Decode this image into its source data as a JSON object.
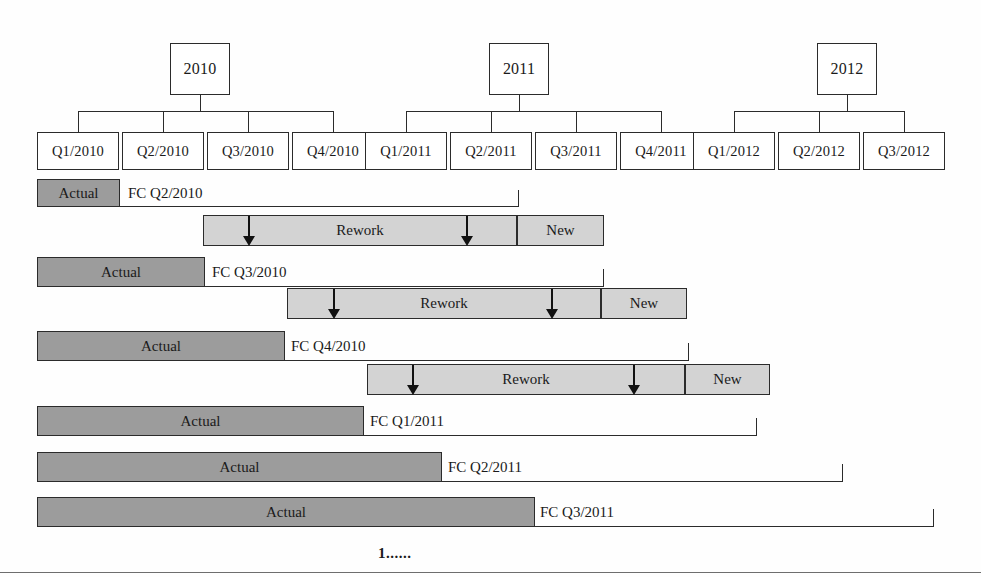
{
  "figure": {
    "footnote": "1......",
    "colors": {
      "actual_fill": "#9c9c9c",
      "forecast_fill": "#d3d3d3",
      "outline": "#2b2b2b",
      "background": "#ffffff"
    }
  },
  "timeline": {
    "years": [
      {
        "label": "2010",
        "x": 170,
        "width": 60,
        "quarters": 4
      },
      {
        "label": "2011",
        "x": 489,
        "width": 60,
        "quarters": 4
      },
      {
        "label": "2012",
        "x": 817,
        "width": 60,
        "quarters": 3
      }
    ],
    "quarters": [
      {
        "label": "Q1/2010",
        "x": 37,
        "width": 82
      },
      {
        "label": "Q2/2010",
        "x": 122,
        "width": 82
      },
      {
        "label": "Q3/2010",
        "x": 207,
        "width": 82
      },
      {
        "label": "Q4/2010",
        "x": 292,
        "width": 82
      },
      {
        "label": "Q1/2011",
        "x": 365,
        "width": 82
      },
      {
        "label": "Q2/2011",
        "x": 450,
        "width": 82
      },
      {
        "label": "Q3/2011",
        "x": 535,
        "width": 82
      },
      {
        "label": "Q4/2011",
        "x": 620,
        "width": 82
      },
      {
        "label": "Q1/2012",
        "x": 693,
        "width": 82
      },
      {
        "label": "Q2/2012",
        "x": 778,
        "width": 82
      },
      {
        "label": "Q3/2012",
        "x": 863,
        "width": 82
      }
    ]
  },
  "rows": [
    {
      "actual_label": "Actual",
      "actual_x": 37,
      "actual_width": 83,
      "fc_label": "FC Q2/2010",
      "fc_label_x": 128,
      "horizon_end": 518,
      "rework_label": "Rework",
      "rework_x": 203,
      "rework_width": 314,
      "new_label": "New",
      "new_x": 517,
      "new_width": 87,
      "arrows": [
        248,
        466
      ]
    },
    {
      "actual_label": "Actual",
      "actual_x": 37,
      "actual_width": 168,
      "fc_label": "FC Q3/2010",
      "fc_label_x": 212,
      "horizon_end": 603,
      "rework_label": "Rework",
      "rework_x": 287,
      "rework_width": 314,
      "new_label": "New",
      "new_x": 601,
      "new_width": 86,
      "arrows": [
        333,
        551
      ]
    },
    {
      "actual_label": "Actual",
      "actual_x": 37,
      "actual_width": 248,
      "fc_label": "FC Q4/2010",
      "fc_label_x": 291,
      "horizon_end": 688,
      "rework_label": "Rework",
      "rework_x": 367,
      "rework_width": 318,
      "new_label": "New",
      "new_x": 685,
      "new_width": 85,
      "arrows": [
        412,
        633
      ]
    },
    {
      "actual_label": "Actual",
      "actual_x": 37,
      "actual_width": 327,
      "fc_label": "FC Q1/2011",
      "fc_label_x": 370,
      "horizon_end": 756,
      "rework_label": null,
      "new_label": null,
      "arrows": []
    },
    {
      "actual_label": "Actual",
      "actual_x": 37,
      "actual_width": 405,
      "fc_label": "FC Q2/2011",
      "fc_label_x": 448,
      "horizon_end": 842,
      "rework_label": null,
      "new_label": null,
      "arrows": []
    },
    {
      "actual_label": "Actual",
      "actual_x": 37,
      "actual_width": 498,
      "fc_label": "FC Q3/2011",
      "fc_label_x": 540,
      "horizon_end": 933,
      "rework_label": null,
      "new_label": null,
      "arrows": []
    }
  ]
}
